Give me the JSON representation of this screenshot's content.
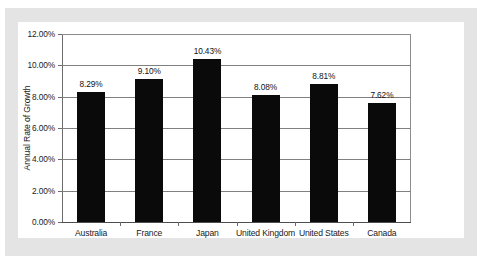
{
  "chart_data": {
    "type": "bar",
    "title": "",
    "xlabel": "",
    "ylabel": "Annual Rate of Growth",
    "categories": [
      "Australia",
      "France",
      "Japan",
      "United Kingdom",
      "United States",
      "Canada"
    ],
    "values": [
      8.29,
      9.1,
      10.43,
      8.08,
      8.81,
      7.62
    ],
    "value_labels": [
      "8.29%",
      "9.10%",
      "10.43%",
      "8.08%",
      "8.81%",
      "7.62%"
    ],
    "ylim": [
      0,
      12
    ],
    "ytick_values": [
      0,
      2,
      4,
      6,
      8,
      10,
      12
    ],
    "ytick_labels": [
      "0.00%",
      "2.00%",
      "4.00%",
      "6.00%",
      "8.00%",
      "10.00%",
      "12.00%"
    ],
    "grid": true,
    "legend": "none",
    "bar_color": "#0a0a0a",
    "gridline_color": "#808080",
    "panel_color": "#ffffff",
    "mat_color": "#e4e4e4"
  }
}
